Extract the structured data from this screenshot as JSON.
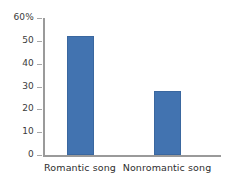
{
  "chart_data": {
    "type": "bar",
    "title": "",
    "xlabel": "",
    "ylabel": "",
    "categories": [
      "Romantic song",
      "Nonromantic song"
    ],
    "values": [
      52,
      28
    ],
    "ylim": [
      0,
      60
    ],
    "yticks": [
      0,
      10,
      20,
      30,
      40,
      50,
      60
    ],
    "ytick_labels": [
      "0",
      "10",
      "20",
      "30",
      "40",
      "50",
      "60%"
    ],
    "grid": false,
    "legend": null,
    "series": [
      {
        "name": "Percent",
        "values": [
          52,
          28
        ]
      }
    ],
    "colors": {
      "bar": "#4273b0",
      "bar_border": "#3a679f",
      "axis": "#9a9a9a",
      "text": "#2e2e2e",
      "background": "#ffffff"
    }
  }
}
